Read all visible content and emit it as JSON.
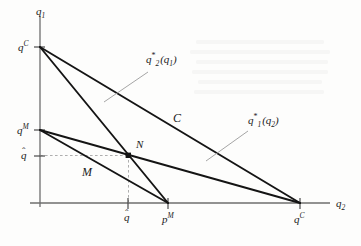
{
  "figure": {
    "kind": "cournot-reaction-function-diagram",
    "background_color": "#fdfdfc",
    "ink_color": "#1b1b1b",
    "grid_color": "#b9b9b9"
  },
  "axes": {
    "vertical_label": "q",
    "vertical_label_sub": "1",
    "horizontal_label": "q",
    "horizontal_label_sub": "2",
    "origin_px": [
      40,
      203
    ],
    "vertical_top_px": [
      40,
      16
    ],
    "horizontal_right_px": [
      330,
      203
    ]
  },
  "ticks": {
    "vertical": [
      {
        "name": "q-c-vertical",
        "base": "q",
        "super": "C",
        "hat": false,
        "value_px": 47
      },
      {
        "name": "q-m-vertical",
        "base": "q",
        "super": "M",
        "hat": false,
        "value_px": 130
      },
      {
        "name": "q-hat-vertical",
        "base": "q",
        "super": "",
        "hat": true,
        "value_px": 157
      }
    ],
    "horizontal": [
      {
        "name": "q-hat-horizontal",
        "base": "q",
        "super": "",
        "hat": true,
        "value_px": 128
      },
      {
        "name": "p-m-horizontal",
        "base": "p",
        "super": "M",
        "hat": false,
        "value_px": 168
      },
      {
        "name": "q-c-horizontal",
        "base": "q",
        "super": "C",
        "hat": false,
        "value_px": 300
      }
    ]
  },
  "curves": [
    {
      "name": "best-response-q2-of-q1",
      "label_base": "q",
      "label_sub": "2",
      "label_star": "*",
      "label_arg": "(q",
      "label_arg_sub": "1",
      "label_arg_close": ")",
      "from_px": [
        40,
        47
      ],
      "to_px": [
        300,
        203
      ],
      "label_px": [
        148,
        54
      ],
      "leader_from_px": [
        148,
        72
      ],
      "leader_to_px": [
        106,
        101
      ]
    },
    {
      "name": "best-response-q1-of-q2",
      "label_base": "q",
      "label_sub": "1",
      "label_star": "*",
      "label_arg": "(q",
      "label_arg_sub": "2",
      "label_arg_close": ")",
      "from_px": [
        40,
        130
      ],
      "to_px": [
        300,
        203
      ],
      "label_px": [
        250,
        116
      ],
      "leader_from_px": [
        250,
        132
      ],
      "leader_to_px": [
        208,
        160
      ]
    },
    {
      "name": "collusive-isoquant-line-C",
      "from_px": [
        40,
        47
      ],
      "to_px": [
        168,
        203
      ]
    },
    {
      "name": "monopoly-isoquant-line-M",
      "from_px": [
        40,
        130
      ],
      "to_px": [
        168,
        203
      ]
    }
  ],
  "region_labels": [
    {
      "name": "label-C",
      "text": "C",
      "px": [
        176,
        118
      ]
    },
    {
      "name": "label-M",
      "text": "M",
      "px": [
        84,
        172
      ]
    }
  ],
  "points": [
    {
      "name": "nash-equilibrium-point",
      "label": "N",
      "marker_px": [
        128,
        155
      ],
      "label_px": [
        136,
        143
      ]
    }
  ],
  "guides": [
    {
      "name": "nash-horizontal-guide",
      "from_px": [
        40,
        155
      ],
      "to_px": [
        128,
        155
      ],
      "style": "dashed"
    },
    {
      "name": "nash-vertical-guide",
      "from_px": [
        128,
        155
      ],
      "to_px": [
        128,
        203
      ],
      "style": "dashed"
    }
  ]
}
